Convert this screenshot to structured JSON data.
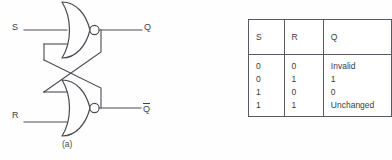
{
  "figure": {
    "kind": "sr-latch-nor-figure",
    "background_color": "#fefefe",
    "line_color": "#4a4a52"
  },
  "panel_a": {
    "caption": "(a)",
    "circuit_name": "cross-coupled NOR SR latch",
    "gates": [
      {
        "name": "top-nor-gate",
        "type": "NOR",
        "inputs": [
          "S",
          "Qbar-feedback"
        ],
        "output": "Q"
      },
      {
        "name": "bottom-nor-gate",
        "type": "NOR",
        "inputs": [
          "Q-feedback",
          "R"
        ],
        "output": "Qbar"
      }
    ],
    "labels": {
      "set_input": "S",
      "reset_input": "R",
      "q_output": "Q",
      "qbar_output": "Q",
      "qbar_overbar": true
    }
  },
  "panel_b": {
    "caption": "(b)",
    "table": {
      "headers": [
        "S",
        "R",
        "Q"
      ],
      "rows": [
        [
          "0",
          "0",
          "Invalid"
        ],
        [
          "0",
          "1",
          "1"
        ],
        [
          "1",
          "0",
          "0"
        ],
        [
          "1",
          "1",
          "Unchanged"
        ]
      ]
    }
  }
}
